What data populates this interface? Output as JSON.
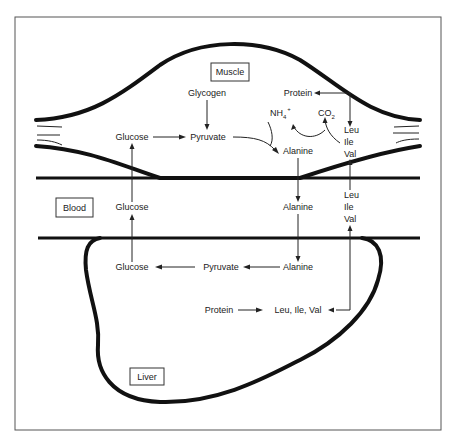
{
  "diagram": {
    "type": "glucose-alanine cycle",
    "compartments": {
      "muscle": "Muscle",
      "blood": "Blood",
      "liver": "Liver"
    },
    "muscle": {
      "glycogen": "Glycogen",
      "glucose": "Glucose",
      "pyruvate": "Pyruvate",
      "alanine": "Alanine",
      "protein": "Protein",
      "nh4": "NH",
      "nh4_sub": "4",
      "nh4_sup": "+",
      "co2": "CO",
      "co2_sub": "2",
      "bcaa": [
        "Leu",
        "Ile",
        "Val"
      ]
    },
    "blood": {
      "glucose": "Glucose",
      "alanine": "Alanine",
      "bcaa": [
        "Leu",
        "Ile",
        "Val"
      ]
    },
    "liver": {
      "glucose": "Glucose",
      "pyruvate": "Pyruvate",
      "alanine": "Alanine",
      "protein": "Protein",
      "bcaa_combined": "Leu, Ile, Val"
    }
  }
}
